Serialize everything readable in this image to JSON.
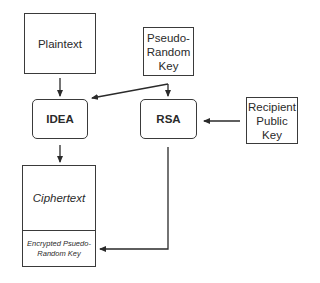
{
  "diagram": {
    "nodes": {
      "plaintext": {
        "label": "Plaintext"
      },
      "prk": {
        "line1": "Pseudo-",
        "line2": "Random",
        "line3": "Key"
      },
      "idea": {
        "label": "IDEA"
      },
      "rsa": {
        "label": "RSA"
      },
      "rpk": {
        "line1": "Recipient",
        "line2": "Public",
        "line3": "Key"
      },
      "output": {
        "top_label": "Ciphertext",
        "bottom_line1": "Encrypted Psuedo-",
        "bottom_line2": "Random Key"
      }
    },
    "edges": [
      {
        "from": "Plaintext",
        "to": "IDEA"
      },
      {
        "from": "Pseudo-Random Key",
        "to": "IDEA"
      },
      {
        "from": "Pseudo-Random Key",
        "to": "RSA"
      },
      {
        "from": "Recipient Public Key",
        "to": "RSA"
      },
      {
        "from": "IDEA",
        "to": "Ciphertext"
      },
      {
        "from": "RSA",
        "to": "Encrypted Psuedo-Random Key"
      }
    ],
    "colors": {
      "stroke": "#3a3a3a",
      "background": "#ffffff",
      "text": "#2a2a2a"
    }
  }
}
